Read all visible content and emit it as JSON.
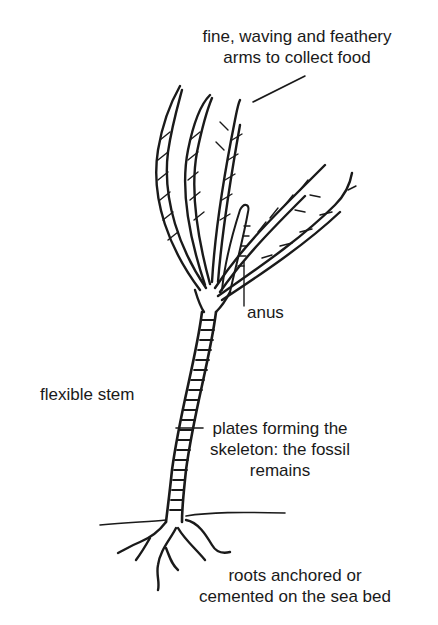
{
  "diagram": {
    "labels": {
      "arms": [
        "fine, waving and feathery",
        "arms to collect food"
      ],
      "anus": "anus",
      "stem": "flexible stem",
      "plates": [
        "plates forming the",
        "skeleton: the fossil",
        "remains"
      ],
      "roots": [
        "roots anchored or",
        "cemented on the sea bed"
      ]
    },
    "colors": {
      "ink": "#1a1a1a",
      "background": "#ffffff"
    }
  }
}
